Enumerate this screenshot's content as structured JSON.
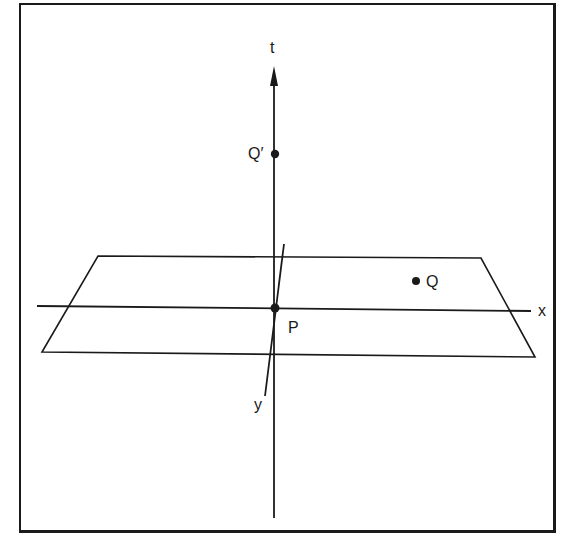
{
  "diagram": {
    "type": "spacetime-axes-with-plane",
    "axes": {
      "t": {
        "label": "t"
      },
      "x": {
        "label": "x"
      },
      "y": {
        "label": "y"
      }
    },
    "points": [
      {
        "id": "P",
        "label": "P"
      },
      {
        "id": "Q",
        "label": "Q"
      },
      {
        "id": "Q_prime",
        "label": "Q′"
      }
    ],
    "colors": {
      "ink": "#1a1a1a",
      "background": "#ffffff"
    }
  }
}
